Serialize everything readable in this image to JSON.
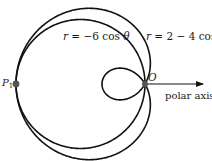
{
  "figure": {
    "type": "polar-curves-diagram",
    "curves": [
      {
        "id": "circle",
        "equation_label": "r = −6 cos θ",
        "label_parts": {
          "var": "r",
          "rhs": " = −6 cos ",
          "theta": "θ"
        },
        "a": 0,
        "b": -6,
        "stroke": "#111111"
      },
      {
        "id": "limacon",
        "equation_label": "r = 2 − 4 cos θ",
        "label_parts": {
          "var": "r",
          "rhs": " = 2 − 4 cos ",
          "theta": "θ"
        },
        "a": 2,
        "b": -4,
        "stroke": "#111111"
      }
    ],
    "points": [
      {
        "id": "P1",
        "label": "P",
        "subscript": "1",
        "polar": {
          "r": 6,
          "theta_deg": 180
        },
        "color": "#555555"
      },
      {
        "id": "O",
        "label": "O",
        "polar": {
          "r": 0,
          "theta_deg": 0
        },
        "color": "#555555"
      }
    ],
    "axis": {
      "label": "polar axis",
      "from_x": 0,
      "to_x": 2.7
    },
    "layout": {
      "origin_px": [
        145,
        84
      ],
      "scale_px_per_unit": 21.5
    }
  }
}
